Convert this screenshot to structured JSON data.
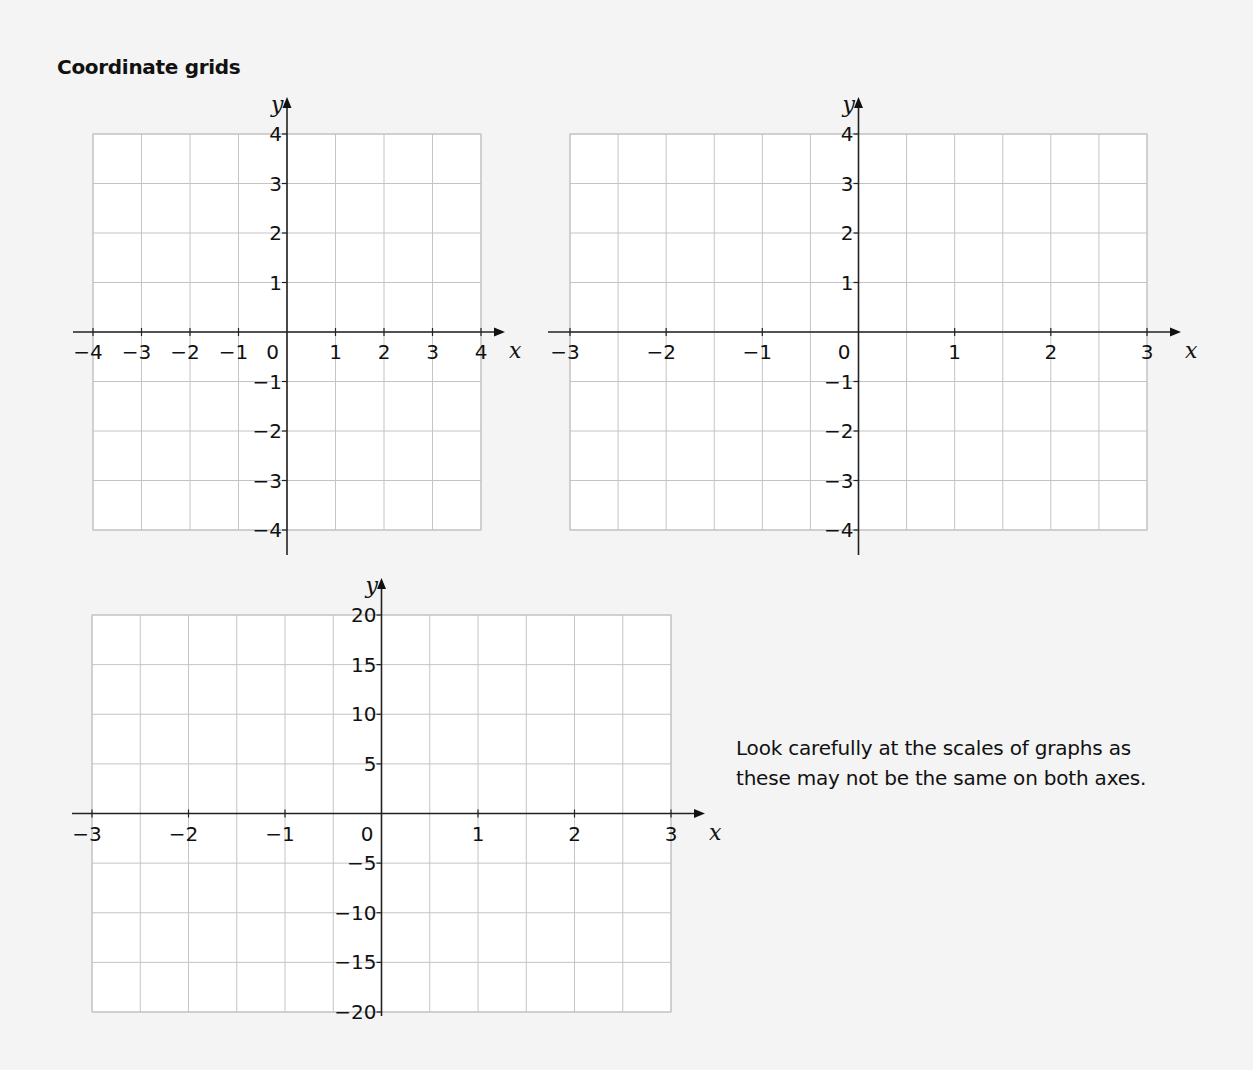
{
  "page": {
    "title": "Coordinate grids",
    "note": "Look carefully at the scales of graphs as these may not be the same on both axes."
  },
  "chart_data": [
    {
      "type": "grid",
      "title": "",
      "xlabel": "x",
      "ylabel": "y",
      "xlim": [
        -4,
        4
      ],
      "ylim": [
        -4,
        4
      ],
      "x_ticks": [
        -4,
        -3,
        -2,
        -1,
        0,
        1,
        2,
        3,
        4
      ],
      "y_ticks": [
        -4,
        -3,
        -2,
        -1,
        1,
        2,
        3,
        4
      ],
      "x_grid_step": 1,
      "y_grid_step": 1,
      "grid": true,
      "series": []
    },
    {
      "type": "grid",
      "title": "",
      "xlabel": "x",
      "ylabel": "y",
      "xlim": [
        -3,
        3
      ],
      "ylim": [
        -4,
        4
      ],
      "x_ticks": [
        -3,
        -2,
        -1,
        0,
        1,
        2,
        3
      ],
      "y_ticks": [
        -4,
        -3,
        -2,
        -1,
        1,
        2,
        3,
        4
      ],
      "x_grid_step": 0.5,
      "y_grid_step": 1,
      "grid": true,
      "series": []
    },
    {
      "type": "grid",
      "title": "",
      "xlabel": "x",
      "ylabel": "y",
      "xlim": [
        -3,
        3
      ],
      "ylim": [
        -20,
        20
      ],
      "x_ticks": [
        -3,
        -2,
        -1,
        0,
        1,
        2,
        3
      ],
      "y_ticks": [
        -20,
        -15,
        -10,
        -5,
        5,
        10,
        15,
        20
      ],
      "x_grid_step": 0.5,
      "y_grid_step": 5,
      "grid": true,
      "series": []
    }
  ],
  "layout": [
    {
      "gx0": 93,
      "gx1": 481,
      "gy0": 134,
      "gy1": 530,
      "ax0": 73,
      "ax1": 505,
      "ay0": 97,
      "ay1": 555
    },
    {
      "gx0": 570,
      "gx1": 1147,
      "gy0": 134,
      "gy1": 530,
      "ax0": 548,
      "ax1": 1181,
      "ay0": 97,
      "ay1": 555
    },
    {
      "gx0": 92,
      "gx1": 671,
      "gy0": 615,
      "gy1": 1012,
      "ax0": 72,
      "ax1": 705,
      "ay0": 578,
      "ay1": 1016
    }
  ]
}
